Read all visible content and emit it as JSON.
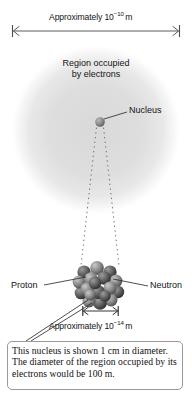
{
  "figure": {
    "type": "atom-scale-diagram",
    "background": "#ffffff",
    "cloud_color": "#e2e2e2",
    "line_color": "#4a4a4a",
    "box_border_color": "#9a9a9a"
  },
  "top_dimension": {
    "name": "atom-diameter-dimension",
    "text_prefix": "Approximately 10",
    "exponent": "−10",
    "unit": "m",
    "full_text": "Approximately 10−10 m"
  },
  "bottom_dimension": {
    "name": "nucleus-diameter-dimension",
    "text_prefix": "Approximately 10",
    "exponent": "−14",
    "unit": "m",
    "full_text": "Approximately 10−14 m"
  },
  "region_label": {
    "line1": "Region occupied",
    "line2": "by electrons"
  },
  "callouts": {
    "nucleus": "Nucleus",
    "proton": "Proton",
    "neutron": "Neutron"
  },
  "caption": {
    "text": "This nucleus is shown 1 cm in diameter. The diameter of the region occupied by its electrons would be 100 m."
  }
}
